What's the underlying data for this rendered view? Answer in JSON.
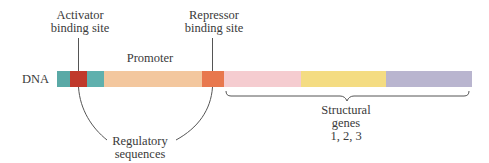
{
  "labels": {
    "dna": "DNA",
    "activator": [
      "Activator",
      "binding site"
    ],
    "repressor": [
      "Repressor",
      "binding site"
    ],
    "promoter": "Promoter",
    "regulatory": [
      "Regulatory",
      "sequences"
    ],
    "structural": [
      "Structural",
      "genes",
      "1, 2, 3"
    ]
  },
  "segments": [
    {
      "name": "teal-left",
      "color": "#5aa9a6"
    },
    {
      "name": "activator-binding-site",
      "color": "#c0392b"
    },
    {
      "name": "teal-right",
      "color": "#5fb0ad"
    },
    {
      "name": "promoter",
      "color": "#f3c79e"
    },
    {
      "name": "repressor-binding-site",
      "color": "#e8784e"
    },
    {
      "name": "structural-gene-1",
      "color": "#f5ccd0"
    },
    {
      "name": "structural-gene-2",
      "color": "#f4dc82"
    },
    {
      "name": "structural-gene-3",
      "color": "#b9b5cf"
    }
  ]
}
